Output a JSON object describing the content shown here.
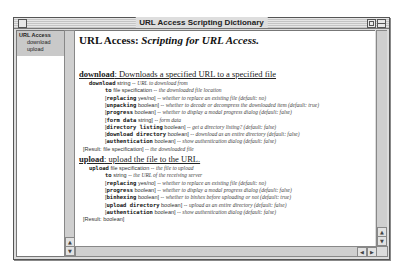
{
  "window": {
    "title": "URL Access Scripting Dictionary"
  },
  "sidebar": {
    "suite": "URL Access",
    "items": [
      "download",
      "upload"
    ]
  },
  "main": {
    "heading_plain": "URL Access: ",
    "heading_italic": "Scripting for URL Access.",
    "sections": [
      {
        "command": "download",
        "description": ": Downloads a specified URL to a specified file",
        "params": [
          {
            "indent": 1,
            "bracket": false,
            "name": "download",
            "type": "string",
            "desc": "URL to download from"
          },
          {
            "indent": 2,
            "bracket": false,
            "name": "to",
            "type": "file specification",
            "desc": "the downloaded file location"
          },
          {
            "indent": 2,
            "bracket": true,
            "name": "replacing",
            "type": "yes/no",
            "desc": "whether to replace an existing file (default: no)"
          },
          {
            "indent": 2,
            "bracket": true,
            "name": "unpacking",
            "type": "boolean",
            "desc": "whether to decode or decompress the downloaded item (default: true)"
          },
          {
            "indent": 2,
            "bracket": true,
            "name": "progress",
            "type": "boolean",
            "desc": "whether to display a modal progress dialog (default: false)"
          },
          {
            "indent": 2,
            "bracket": true,
            "name": "form data",
            "type": "string",
            "desc": "form data"
          },
          {
            "indent": 2,
            "bracket": true,
            "name": "directory listing",
            "type": "boolean",
            "desc": "get a directory listing? (default: false)"
          },
          {
            "indent": 2,
            "bracket": true,
            "name": "download directory",
            "type": "boolean",
            "desc": "download as an entire directory (default: false)"
          },
          {
            "indent": 2,
            "bracket": true,
            "name": "authentication",
            "type": "boolean",
            "desc": "show authentication dialog (default: false)"
          }
        ],
        "result": {
          "label": "[Result:",
          "type": "file specification]",
          "desc": "the downloaded file"
        }
      },
      {
        "command": "upload",
        "description": ": upload the file to the URL.",
        "params": [
          {
            "indent": 1,
            "bracket": false,
            "name": "upload",
            "type": "file specification",
            "desc": "the file to upload"
          },
          {
            "indent": 2,
            "bracket": false,
            "name": "to",
            "type": "string",
            "desc": "the URL of the receiving server"
          },
          {
            "indent": 2,
            "bracket": true,
            "name": "replacing",
            "type": "yes/no",
            "desc": "whether to replace an existing file (default: no)"
          },
          {
            "indent": 2,
            "bracket": true,
            "name": "progress",
            "type": "boolean",
            "desc": "whether to display a modal progress dialog (default: false)"
          },
          {
            "indent": 2,
            "bracket": true,
            "name": "binhexing",
            "type": "boolean",
            "desc": "whether to binhex before uploading or not (default: true)"
          },
          {
            "indent": 2,
            "bracket": true,
            "name": "upload directory",
            "type": "boolean",
            "desc": "upload as an entire directory (default: false)"
          },
          {
            "indent": 2,
            "bracket": true,
            "name": "authentication",
            "type": "boolean",
            "desc": "show authentication dialog (default: false)"
          }
        ],
        "result": {
          "label": "[Result:",
          "type": "boolean]",
          "desc": ""
        }
      }
    ]
  },
  "scrollbars": {
    "up_arrow": "▲",
    "down_arrow": "▼",
    "left_arrow": "◀",
    "right_arrow": "▶"
  }
}
